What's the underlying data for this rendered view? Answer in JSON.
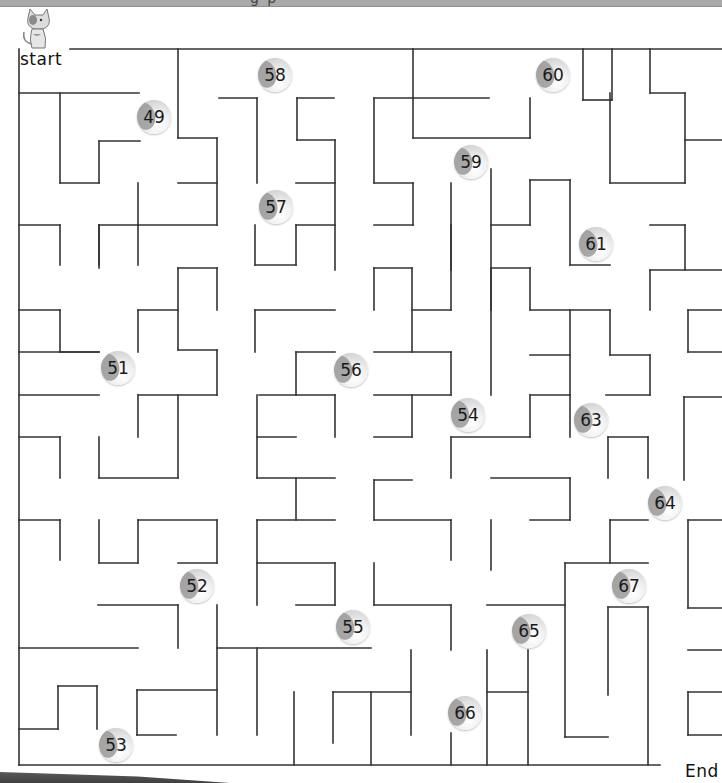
{
  "worksheet": {
    "banner_text": "g   p",
    "start_label": "start",
    "end_label": "End",
    "mascot": "cat-icon"
  },
  "maze": {
    "wall_color": "#333333",
    "wall_width": 1.6,
    "walls": [
      [
        70,
        49,
        722,
        49
      ],
      [
        19,
        49,
        19,
        765
      ],
      [
        19,
        765,
        660,
        765
      ],
      [
        19,
        93,
        139,
        93
      ],
      [
        60,
        93,
        60,
        183
      ],
      [
        60,
        183,
        99,
        183
      ],
      [
        99,
        183,
        99,
        141
      ],
      [
        99,
        141,
        140,
        141
      ],
      [
        178,
        49,
        178,
        138
      ],
      [
        178,
        138,
        217,
        138
      ],
      [
        217,
        138,
        217,
        225
      ],
      [
        217,
        183,
        178,
        183
      ],
      [
        138,
        183,
        138,
        225
      ],
      [
        99,
        225,
        217,
        225
      ],
      [
        99,
        225,
        99,
        265
      ],
      [
        138,
        225,
        138,
        265
      ],
      [
        219,
        98,
        257,
        98
      ],
      [
        257,
        98,
        257,
        183
      ],
      [
        297,
        98,
        334,
        98
      ],
      [
        297,
        98,
        297,
        140
      ],
      [
        297,
        140,
        335,
        140
      ],
      [
        335,
        140,
        335,
        270
      ],
      [
        296,
        183,
        335,
        183
      ],
      [
        296,
        225,
        335,
        225
      ],
      [
        296,
        225,
        296,
        265
      ],
      [
        255,
        265,
        296,
        265
      ],
      [
        255,
        225,
        255,
        265
      ],
      [
        413,
        49,
        413,
        138
      ],
      [
        413,
        138,
        530,
        138
      ],
      [
        530,
        138,
        530,
        98
      ],
      [
        413,
        98,
        489,
        98
      ],
      [
        374,
        98,
        413,
        98
      ],
      [
        374,
        98,
        374,
        183
      ],
      [
        374,
        183,
        413,
        183
      ],
      [
        413,
        183,
        413,
        225
      ],
      [
        374,
        225,
        413,
        225
      ],
      [
        451,
        183,
        451,
        270
      ],
      [
        491,
        169,
        491,
        310
      ],
      [
        491,
        225,
        530,
        225
      ],
      [
        530,
        225,
        530,
        180
      ],
      [
        530,
        180,
        570,
        180
      ],
      [
        570,
        180,
        570,
        265
      ],
      [
        570,
        265,
        610,
        265
      ],
      [
        583,
        49,
        583,
        100
      ],
      [
        583,
        100,
        612,
        100
      ],
      [
        612,
        49,
        612,
        100
      ],
      [
        650,
        49,
        650,
        93
      ],
      [
        650,
        93,
        685,
        93
      ],
      [
        610,
        93,
        610,
        183
      ],
      [
        610,
        183,
        685,
        183
      ],
      [
        685,
        93,
        685,
        183
      ],
      [
        685,
        140,
        722,
        140
      ],
      [
        650,
        225,
        685,
        225
      ],
      [
        685,
        225,
        685,
        270
      ],
      [
        650,
        270,
        722,
        270
      ],
      [
        650,
        270,
        650,
        310
      ],
      [
        19,
        225,
        60,
        225
      ],
      [
        60,
        225,
        60,
        265
      ],
      [
        99,
        225,
        99,
        268
      ],
      [
        19,
        310,
        60,
        310
      ],
      [
        60,
        310,
        60,
        352
      ],
      [
        60,
        352,
        99,
        352
      ],
      [
        138,
        310,
        178,
        310
      ],
      [
        138,
        310,
        138,
        352
      ],
      [
        178,
        268,
        178,
        350
      ],
      [
        178,
        268,
        217,
        268
      ],
      [
        217,
        268,
        217,
        310
      ],
      [
        178,
        350,
        217,
        350
      ],
      [
        217,
        350,
        217,
        395
      ],
      [
        19,
        352,
        99,
        352
      ],
      [
        19,
        395,
        99,
        395
      ],
      [
        138,
        395,
        217,
        395
      ],
      [
        255,
        310,
        335,
        310
      ],
      [
        255,
        310,
        255,
        352
      ],
      [
        296,
        352,
        335,
        352
      ],
      [
        296,
        352,
        296,
        395
      ],
      [
        259,
        395,
        335,
        395
      ],
      [
        335,
        395,
        335,
        437
      ],
      [
        374,
        268,
        412,
        268
      ],
      [
        374,
        268,
        374,
        310
      ],
      [
        412,
        268,
        412,
        352
      ],
      [
        412,
        310,
        451,
        310
      ],
      [
        451,
        310,
        451,
        225
      ],
      [
        374,
        352,
        451,
        352
      ],
      [
        451,
        352,
        451,
        395
      ],
      [
        374,
        395,
        451,
        395
      ],
      [
        412,
        395,
        412,
        437
      ],
      [
        374,
        437,
        412,
        437
      ],
      [
        491,
        268,
        491,
        395
      ],
      [
        491,
        268,
        530,
        268
      ],
      [
        530,
        268,
        530,
        310
      ],
      [
        530,
        310,
        610,
        310
      ],
      [
        570,
        310,
        570,
        395
      ],
      [
        530,
        355,
        570,
        355
      ],
      [
        610,
        310,
        610,
        355
      ],
      [
        610,
        355,
        650,
        355
      ],
      [
        650,
        355,
        650,
        395
      ],
      [
        606,
        395,
        650,
        395
      ],
      [
        688,
        310,
        722,
        310
      ],
      [
        688,
        310,
        688,
        352
      ],
      [
        688,
        352,
        722,
        352
      ],
      [
        19,
        437,
        60,
        437
      ],
      [
        60,
        437,
        60,
        478
      ],
      [
        99,
        437,
        99,
        478
      ],
      [
        99,
        478,
        178,
        478
      ],
      [
        178,
        395,
        178,
        478
      ],
      [
        138,
        395,
        138,
        437
      ],
      [
        257,
        395,
        257,
        478
      ],
      [
        257,
        437,
        296,
        437
      ],
      [
        257,
        478,
        335,
        478
      ],
      [
        296,
        478,
        296,
        520
      ],
      [
        257,
        520,
        335,
        520
      ],
      [
        451,
        437,
        451,
        478
      ],
      [
        451,
        437,
        530,
        437
      ],
      [
        530,
        437,
        530,
        395
      ],
      [
        530,
        395,
        570,
        395
      ],
      [
        570,
        395,
        570,
        437
      ],
      [
        608,
        437,
        648,
        437
      ],
      [
        608,
        437,
        608,
        478
      ],
      [
        648,
        437,
        648,
        478
      ],
      [
        684,
        397,
        722,
        397
      ],
      [
        684,
        397,
        684,
        480
      ],
      [
        19,
        520,
        60,
        520
      ],
      [
        60,
        520,
        60,
        560
      ],
      [
        99,
        520,
        99,
        563
      ],
      [
        99,
        563,
        138,
        563
      ],
      [
        138,
        520,
        138,
        563
      ],
      [
        138,
        520,
        217,
        520
      ],
      [
        217,
        520,
        217,
        563
      ],
      [
        178,
        563,
        217,
        563
      ],
      [
        374,
        480,
        374,
        520
      ],
      [
        374,
        480,
        412,
        480
      ],
      [
        374,
        520,
        451,
        520
      ],
      [
        451,
        520,
        451,
        560
      ],
      [
        491,
        478,
        570,
        478
      ],
      [
        570,
        478,
        570,
        520
      ],
      [
        257,
        520,
        257,
        605
      ],
      [
        257,
        563,
        335,
        563
      ],
      [
        335,
        563,
        335,
        605
      ],
      [
        296,
        605,
        335,
        605
      ],
      [
        374,
        563,
        374,
        605
      ],
      [
        374,
        605,
        451,
        605
      ],
      [
        451,
        605,
        451,
        650
      ],
      [
        491,
        520,
        491,
        570
      ],
      [
        530,
        520,
        570,
        520
      ],
      [
        610,
        520,
        648,
        520
      ],
      [
        610,
        520,
        610,
        563
      ],
      [
        565,
        563,
        648,
        563
      ],
      [
        565,
        563,
        565,
        737
      ],
      [
        565,
        737,
        608,
        737
      ],
      [
        688,
        520,
        722,
        520
      ],
      [
        688,
        520,
        688,
        608
      ],
      [
        688,
        608,
        722,
        608
      ],
      [
        98,
        605,
        178,
        605
      ],
      [
        178,
        605,
        178,
        648
      ],
      [
        217,
        605,
        217,
        735
      ],
      [
        217,
        648,
        371,
        648
      ],
      [
        257,
        648,
        257,
        735
      ],
      [
        19,
        648,
        138,
        648
      ],
      [
        487,
        605,
        565,
        605
      ],
      [
        608,
        607,
        648,
        607
      ],
      [
        608,
        607,
        608,
        695
      ],
      [
        648,
        607,
        648,
        765
      ],
      [
        411,
        650,
        411,
        735
      ],
      [
        333,
        692,
        411,
        692
      ],
      [
        333,
        692,
        333,
        743
      ],
      [
        371,
        692,
        371,
        765
      ],
      [
        294,
        692,
        294,
        765
      ],
      [
        487,
        650,
        487,
        765
      ],
      [
        487,
        692,
        528,
        692
      ],
      [
        528,
        650,
        528,
        765
      ],
      [
        688,
        650,
        722,
        650
      ],
      [
        688,
        692,
        722,
        692
      ],
      [
        688,
        692,
        688,
        735
      ],
      [
        688,
        735,
        722,
        735
      ],
      [
        19,
        729,
        58,
        729
      ],
      [
        58,
        729,
        58,
        686
      ],
      [
        58,
        686,
        97,
        686
      ],
      [
        97,
        686,
        97,
        729
      ],
      [
        137,
        690,
        217,
        690
      ],
      [
        137,
        690,
        137,
        735
      ],
      [
        137,
        735,
        176,
        735
      ],
      [
        451,
        733,
        451,
        765
      ]
    ]
  },
  "checkpoints": [
    {
      "number": "58",
      "x": 258,
      "y": 58
    },
    {
      "number": "60",
      "x": 536,
      "y": 58
    },
    {
      "number": "49",
      "x": 137,
      "y": 100
    },
    {
      "number": "59",
      "x": 454,
      "y": 145
    },
    {
      "number": "57",
      "x": 259,
      "y": 190
    },
    {
      "number": "61",
      "x": 579,
      "y": 227
    },
    {
      "number": "51",
      "x": 101,
      "y": 351
    },
    {
      "number": "56",
      "x": 334,
      "y": 353
    },
    {
      "number": "54",
      "x": 451,
      "y": 398
    },
    {
      "number": "63",
      "x": 574,
      "y": 403
    },
    {
      "number": "64",
      "x": 648,
      "y": 486
    },
    {
      "number": "52",
      "x": 180,
      "y": 569
    },
    {
      "number": "67",
      "x": 612,
      "y": 569
    },
    {
      "number": "55",
      "x": 336,
      "y": 610
    },
    {
      "number": "65",
      "x": 512,
      "y": 614
    },
    {
      "number": "66",
      "x": 448,
      "y": 696
    },
    {
      "number": "53",
      "x": 99,
      "y": 728
    }
  ]
}
